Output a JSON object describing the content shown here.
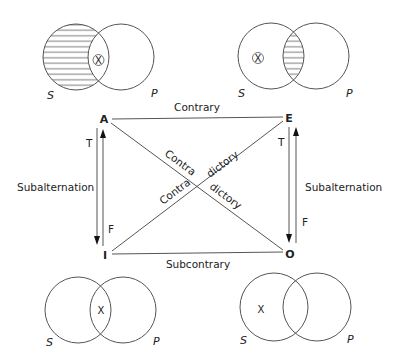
{
  "diagram": {
    "vertices": {
      "A": "A",
      "E": "E",
      "I": "I",
      "O": "O"
    },
    "relations": {
      "top": "Contrary",
      "bottom": "Subcontrary",
      "left": "Subalternation",
      "right": "Subalternation",
      "diag1_a": "Contra",
      "diag1_b": "dictory",
      "diag2_a": "Contra",
      "diag2_b": "dictory"
    },
    "truth_labels": {
      "left_T": "T",
      "left_F": "F",
      "right_T": "T",
      "right_F": "F"
    },
    "venn": {
      "A": {
        "s_label": "S",
        "p_label": "P",
        "mark": "X",
        "shaded": "S-only",
        "mark_circled": true
      },
      "E": {
        "s_label": "S",
        "p_label": "P",
        "mark": "X",
        "shaded": "S-and-P",
        "mark_circled": true
      },
      "I": {
        "s_label": "S",
        "p_label": "P",
        "mark": "X",
        "shaded": "none",
        "mark_circled": false
      },
      "O": {
        "s_label": "S",
        "p_label": "P",
        "mark": "X",
        "shaded": "none",
        "mark_circled": false
      }
    },
    "colors": {
      "line": "#555555",
      "text": "#222222",
      "hatch": "#666666"
    }
  }
}
